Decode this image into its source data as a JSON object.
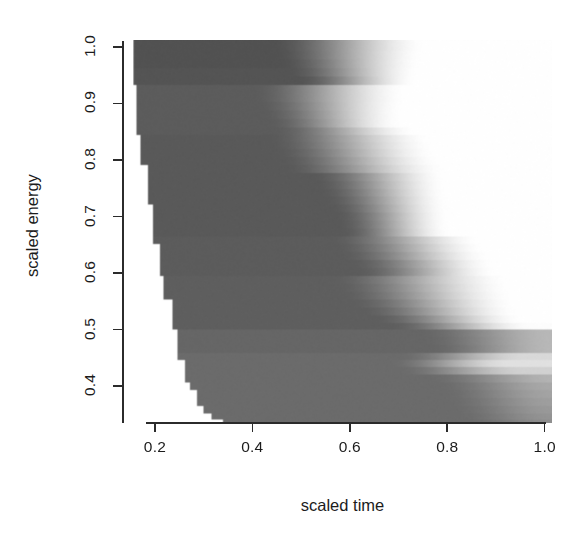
{
  "figure": {
    "background_color": "#ffffff",
    "foreground_color": "#1c1c1c",
    "width": 586,
    "height": 550
  },
  "chart_data": {
    "type": "heatmap",
    "title": "",
    "subtitle": "",
    "xlabel": "scaled time",
    "ylabel": "scaled energy",
    "xlim": [
      0.155,
      1.015
    ],
    "ylim": [
      0.335,
      1.012
    ],
    "xticks": [
      0.2,
      0.4,
      0.6,
      0.8,
      1.0
    ],
    "xtick_labels": [
      "0.2",
      "0.4",
      "0.6",
      "0.8",
      "1.0"
    ],
    "yticks": [
      0.4,
      0.5,
      0.6,
      0.7,
      0.8,
      0.9,
      1.0
    ],
    "ytick_labels": [
      "0.4",
      "0.5",
      "0.6",
      "0.7",
      "0.8",
      "0.9",
      "1.0"
    ],
    "grid": false,
    "legend": "none",
    "colormap": "grayscale",
    "colormap_min_color": "#4a4a4a",
    "colormap_max_color": "#ffffff",
    "missing_color": "#ffffff",
    "note": "Intensity increases (darker to white) toward larger scaled time; lower-left triangular region is blank (no data). Each row is a horizontal band with its own dark-to-white ramp.",
    "rows": [
      {
        "y": 1.0,
        "x_start": 0.156,
        "ramp_start": 0.44,
        "ramp_end": 0.76,
        "dark": 0.32,
        "light": 1.0
      },
      {
        "y": 0.985,
        "x_start": 0.156,
        "ramp_start": 0.445,
        "ramp_end": 0.755,
        "dark": 0.32,
        "light": 1.0
      },
      {
        "y": 0.97,
        "x_start": 0.156,
        "ramp_start": 0.455,
        "ramp_end": 0.75,
        "dark": 0.32,
        "light": 1.0
      },
      {
        "y": 0.955,
        "x_start": 0.156,
        "ramp_start": 0.47,
        "ramp_end": 0.745,
        "dark": 0.33,
        "light": 1.0
      },
      {
        "y": 0.94,
        "x_start": 0.156,
        "ramp_start": 0.49,
        "ramp_end": 0.74,
        "dark": 0.33,
        "light": 1.0
      },
      {
        "y": 0.925,
        "x_start": 0.162,
        "ramp_start": 0.4,
        "ramp_end": 0.72,
        "dark": 0.36,
        "light": 1.0
      },
      {
        "y": 0.91,
        "x_start": 0.162,
        "ramp_start": 0.4,
        "ramp_end": 0.72,
        "dark": 0.36,
        "light": 1.0
      },
      {
        "y": 0.895,
        "x_start": 0.162,
        "ramp_start": 0.41,
        "ramp_end": 0.715,
        "dark": 0.36,
        "light": 1.0
      },
      {
        "y": 0.88,
        "x_start": 0.162,
        "ramp_start": 0.42,
        "ramp_end": 0.712,
        "dark": 0.36,
        "light": 1.0
      },
      {
        "y": 0.865,
        "x_start": 0.162,
        "ramp_start": 0.43,
        "ramp_end": 0.71,
        "dark": 0.36,
        "light": 1.0
      },
      {
        "y": 0.85,
        "x_start": 0.162,
        "ramp_start": 0.44,
        "ramp_end": 0.74,
        "dark": 0.36,
        "light": 1.0
      },
      {
        "y": 0.838,
        "x_start": 0.17,
        "ramp_start": 0.43,
        "ramp_end": 0.77,
        "dark": 0.35,
        "light": 1.0
      },
      {
        "y": 0.826,
        "x_start": 0.17,
        "ramp_start": 0.435,
        "ramp_end": 0.775,
        "dark": 0.35,
        "light": 1.0
      },
      {
        "y": 0.812,
        "x_start": 0.17,
        "ramp_start": 0.445,
        "ramp_end": 0.78,
        "dark": 0.35,
        "light": 1.0
      },
      {
        "y": 0.798,
        "x_start": 0.17,
        "ramp_start": 0.455,
        "ramp_end": 0.79,
        "dark": 0.35,
        "light": 1.0
      },
      {
        "y": 0.784,
        "x_start": 0.186,
        "ramp_start": 0.465,
        "ramp_end": 0.8,
        "dark": 0.35,
        "light": 1.0
      },
      {
        "y": 0.77,
        "x_start": 0.186,
        "ramp_start": 0.52,
        "ramp_end": 0.8,
        "dark": 0.35,
        "light": 1.0
      },
      {
        "y": 0.756,
        "x_start": 0.186,
        "ramp_start": 0.53,
        "ramp_end": 0.802,
        "dark": 0.35,
        "light": 1.0
      },
      {
        "y": 0.742,
        "x_start": 0.186,
        "ramp_start": 0.54,
        "ramp_end": 0.803,
        "dark": 0.35,
        "light": 1.0
      },
      {
        "y": 0.728,
        "x_start": 0.186,
        "ramp_start": 0.55,
        "ramp_end": 0.805,
        "dark": 0.35,
        "light": 1.0
      },
      {
        "y": 0.714,
        "x_start": 0.196,
        "ramp_start": 0.56,
        "ramp_end": 0.806,
        "dark": 0.35,
        "light": 1.0
      },
      {
        "y": 0.7,
        "x_start": 0.196,
        "ramp_start": 0.57,
        "ramp_end": 0.807,
        "dark": 0.35,
        "light": 1.0
      },
      {
        "y": 0.686,
        "x_start": 0.196,
        "ramp_start": 0.575,
        "ramp_end": 0.808,
        "dark": 0.35,
        "light": 1.0
      },
      {
        "y": 0.672,
        "x_start": 0.196,
        "ramp_start": 0.58,
        "ramp_end": 0.81,
        "dark": 0.35,
        "light": 1.0
      },
      {
        "y": 0.658,
        "x_start": 0.196,
        "ramp_start": 0.56,
        "ramp_end": 0.87,
        "dark": 0.36,
        "light": 1.0
      },
      {
        "y": 0.644,
        "x_start": 0.21,
        "ramp_start": 0.57,
        "ramp_end": 0.88,
        "dark": 0.36,
        "light": 1.0
      },
      {
        "y": 0.63,
        "x_start": 0.21,
        "ramp_start": 0.58,
        "ramp_end": 0.89,
        "dark": 0.36,
        "light": 1.0
      },
      {
        "y": 0.616,
        "x_start": 0.21,
        "ramp_start": 0.6,
        "ramp_end": 0.9,
        "dark": 0.36,
        "light": 1.0
      },
      {
        "y": 0.602,
        "x_start": 0.21,
        "ramp_start": 0.61,
        "ramp_end": 0.905,
        "dark": 0.36,
        "light": 1.0
      },
      {
        "y": 0.588,
        "x_start": 0.218,
        "ramp_start": 0.56,
        "ramp_end": 0.93,
        "dark": 0.37,
        "light": 1.0
      },
      {
        "y": 0.574,
        "x_start": 0.218,
        "ramp_start": 0.57,
        "ramp_end": 0.935,
        "dark": 0.37,
        "light": 1.0
      },
      {
        "y": 0.56,
        "x_start": 0.218,
        "ramp_start": 0.58,
        "ramp_end": 0.94,
        "dark": 0.37,
        "light": 1.0
      },
      {
        "y": 0.546,
        "x_start": 0.236,
        "ramp_start": 0.6,
        "ramp_end": 0.945,
        "dark": 0.37,
        "light": 1.0
      },
      {
        "y": 0.532,
        "x_start": 0.236,
        "ramp_start": 0.62,
        "ramp_end": 0.95,
        "dark": 0.37,
        "light": 1.0
      },
      {
        "y": 0.518,
        "x_start": 0.236,
        "ramp_start": 0.65,
        "ramp_end": 0.96,
        "dark": 0.37,
        "light": 1.0
      },
      {
        "y": 0.506,
        "x_start": 0.236,
        "ramp_start": 0.68,
        "ramp_end": 0.975,
        "dark": 0.37,
        "light": 0.99
      },
      {
        "y": 0.494,
        "x_start": 0.246,
        "ramp_start": 0.74,
        "ramp_end": 1.015,
        "dark": 0.4,
        "light": 0.72
      },
      {
        "y": 0.48,
        "x_start": 0.246,
        "ramp_start": 0.75,
        "ramp_end": 1.015,
        "dark": 0.4,
        "light": 0.72
      },
      {
        "y": 0.466,
        "x_start": 0.246,
        "ramp_start": 0.76,
        "ramp_end": 1.015,
        "dark": 0.4,
        "light": 0.72
      },
      {
        "y": 0.452,
        "x_start": 0.246,
        "ramp_start": 0.7,
        "ramp_end": 0.96,
        "dark": 0.42,
        "light": 0.85
      },
      {
        "y": 0.44,
        "x_start": 0.262,
        "ramp_start": 0.68,
        "ramp_end": 0.93,
        "dark": 0.42,
        "light": 0.88
      },
      {
        "y": 0.428,
        "x_start": 0.262,
        "ramp_start": 0.7,
        "ramp_end": 0.96,
        "dark": 0.42,
        "light": 0.82
      },
      {
        "y": 0.414,
        "x_start": 0.262,
        "ramp_start": 0.76,
        "ramp_end": 1.015,
        "dark": 0.42,
        "light": 0.7
      },
      {
        "y": 0.4,
        "x_start": 0.272,
        "ramp_start": 0.78,
        "ramp_end": 1.015,
        "dark": 0.42,
        "light": 0.66
      },
      {
        "y": 0.386,
        "x_start": 0.286,
        "ramp_start": 0.79,
        "ramp_end": 1.015,
        "dark": 0.42,
        "light": 0.64
      },
      {
        "y": 0.372,
        "x_start": 0.286,
        "ramp_start": 0.8,
        "ramp_end": 1.015,
        "dark": 0.42,
        "light": 0.62
      },
      {
        "y": 0.358,
        "x_start": 0.3,
        "ramp_start": 0.81,
        "ramp_end": 1.015,
        "dark": 0.42,
        "light": 0.6
      },
      {
        "y": 0.345,
        "x_start": 0.316,
        "ramp_start": 0.82,
        "ramp_end": 1.015,
        "dark": 0.42,
        "light": 0.58
      },
      {
        "y": 0.337,
        "x_start": 0.34,
        "ramp_start": 0.83,
        "ramp_end": 1.015,
        "dark": 0.42,
        "light": 0.56
      }
    ]
  }
}
